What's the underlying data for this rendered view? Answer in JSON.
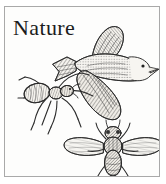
{
  "card": {
    "title": "Nature",
    "border_color": "#a9a9a9",
    "background_color": "#fdfdfc",
    "ink_color": "#2b2b2b"
  },
  "figures": [
    {
      "name": "bird",
      "label": "flying bird engraving",
      "description": "Bird in flight facing right with spread wings and forked tail"
    },
    {
      "name": "ant",
      "label": "ant engraving",
      "description": "Ant with six long legs facing right, abdomen at left"
    },
    {
      "name": "fly",
      "label": "fly engraving",
      "description": "Fly viewed from above with two spread veined wings and antennae"
    }
  ]
}
